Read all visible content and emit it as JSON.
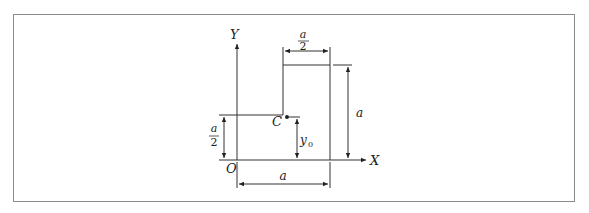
{
  "figure": {
    "type": "L-shaped area cross-section with centroid",
    "axes": {
      "y_label": "Y",
      "x_label": "X",
      "origin_label": "O"
    },
    "centroid": {
      "label": "C",
      "distance_label": "y",
      "distance_subscript": "0"
    },
    "dimensions": {
      "top_width": {
        "numerator": "a",
        "denominator": "2"
      },
      "right_height": "a",
      "left_step_height": {
        "numerator": "a",
        "denominator": "2"
      },
      "bottom_width": "a"
    }
  }
}
